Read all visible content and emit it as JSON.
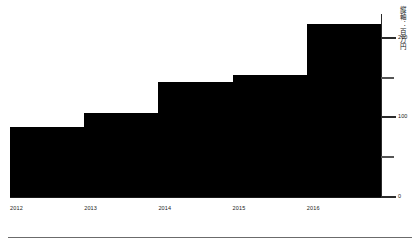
{
  "chart_data": {
    "type": "bar",
    "variant": "step-area",
    "title": "",
    "subtitle": "",
    "xlabel": "",
    "ylabel": "縦軸：百万円",
    "categories": [
      "2012",
      "2013",
      "2014",
      "2015",
      "2016"
    ],
    "values": [
      88,
      105,
      144,
      153,
      218
    ],
    "series": [
      {
        "name": "",
        "values": [
          88,
          105,
          144,
          153,
          218
        ]
      }
    ],
    "ylim": [
      0,
      230
    ],
    "xlim": [
      0,
      5
    ],
    "y_ticks": [
      0,
      50,
      100,
      150,
      200
    ],
    "y_tick_labels": [
      "0",
      "",
      "100",
      "",
      "200"
    ],
    "x_tick_labels": [
      "2012",
      "2013",
      "2014",
      "2015",
      "2016"
    ],
    "grid": false,
    "legend": false,
    "legend_position": "none",
    "axis_position": "right",
    "bar_color": "#000000",
    "axis_color": "#2b2b2b",
    "text_color": "#1a1a1a",
    "background_color": "#ffffff",
    "annotations": []
  },
  "axis": {
    "title_vertical": "縦軸：百万円",
    "ticks": [
      {
        "value": 200,
        "label": "200",
        "major": true
      },
      {
        "value": 150,
        "label": "",
        "major": false
      },
      {
        "value": 100,
        "label": "100",
        "major": true
      },
      {
        "value": 50,
        "label": "",
        "major": false
      },
      {
        "value": 0,
        "label": "0",
        "major": true
      }
    ]
  },
  "footer": {
    "rule_color": "#6b6b6b"
  }
}
